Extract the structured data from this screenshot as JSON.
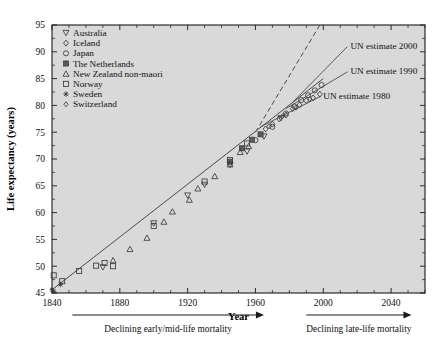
{
  "chart_data": {
    "type": "scatter",
    "title": "",
    "xlabel": "Year",
    "ylabel": "Life expectancy (years)",
    "xlim": [
      1840,
      2060
    ],
    "ylim": [
      45,
      95
    ],
    "xticks": [
      1840,
      1880,
      1920,
      1960,
      2000,
      2040
    ],
    "yticks": [
      45,
      50,
      55,
      60,
      65,
      70,
      75,
      80,
      85,
      90,
      95
    ],
    "xtick_step_minor": 10,
    "ytick_step_minor": 2.5,
    "grid": false,
    "background": "#d9d9d9",
    "legend_position": "upper-left",
    "series": [
      {
        "name": "Australia",
        "marker": "triangle-down",
        "points": [
          [
            1870,
            49.8
          ],
          [
            1900,
            58.0
          ],
          [
            1920,
            63.2
          ],
          [
            1930,
            65.2
          ],
          [
            1945,
            68.9
          ],
          [
            1955,
            71.4
          ],
          [
            1965,
            74.2
          ],
          [
            1975,
            77.6
          ]
        ]
      },
      {
        "name": "Iceland",
        "marker": "diamond",
        "points": [
          [
            1966,
            75.6
          ],
          [
            1970,
            76.5
          ],
          [
            1974,
            77.5
          ],
          [
            1978,
            78.2
          ],
          [
            1982,
            79.4
          ],
          [
            1986,
            80.1
          ],
          [
            1990,
            80.9
          ],
          [
            1994,
            81.4
          ],
          [
            1998,
            82.1
          ]
        ]
      },
      {
        "name": "Japan",
        "marker": "circle",
        "points": [
          [
            1960,
            73.5
          ],
          [
            1970,
            76.0
          ],
          [
            1978,
            78.5
          ],
          [
            1983,
            79.8
          ],
          [
            1987,
            81.0
          ],
          [
            1991,
            81.9
          ],
          [
            1995,
            82.8
          ],
          [
            1999,
            83.8
          ]
        ]
      },
      {
        "name": "The Netherlands",
        "marker": "square-filled",
        "points": [
          [
            1945,
            69.5
          ],
          [
            1952,
            72.0
          ],
          [
            1958,
            73.6
          ],
          [
            1963,
            74.6
          ]
        ]
      },
      {
        "name": "New Zealand non-maori",
        "marker": "triangle-up",
        "points": [
          [
            1876,
            51.1
          ],
          [
            1886,
            53.2
          ],
          [
            1896,
            55.3
          ],
          [
            1906,
            58.3
          ],
          [
            1911,
            60.2
          ],
          [
            1921,
            62.4
          ],
          [
            1926,
            64.5
          ],
          [
            1936,
            66.8
          ],
          [
            1945,
            69.0
          ],
          [
            1951,
            71.3
          ],
          [
            1956,
            72.4
          ]
        ]
      },
      {
        "name": "Norway",
        "marker": "square",
        "points": [
          [
            1841,
            48.3
          ],
          [
            1846,
            47.2
          ],
          [
            1856,
            49.1
          ],
          [
            1866,
            50.1
          ],
          [
            1871,
            50.6
          ],
          [
            1876,
            50.0
          ],
          [
            1900,
            57.5
          ],
          [
            1930,
            65.8
          ],
          [
            1945,
            69.8
          ],
          [
            1955,
            72.9
          ]
        ]
      },
      {
        "name": "Sweden",
        "marker": "asterisk",
        "points": [
          [
            1840,
            45.6
          ],
          [
            1841,
            45.3
          ],
          [
            1845,
            46.6
          ]
        ]
      },
      {
        "name": "Switzerland",
        "marker": "diamond-small",
        "points": [
          [
            1968,
            76.1
          ],
          [
            1976,
            78.0
          ],
          [
            1984,
            79.6
          ],
          [
            1992,
            81.2
          ]
        ]
      }
    ],
    "trend_line": {
      "label": "best-practice linear trend",
      "style": "solid",
      "from": [
        1840,
        45.6
      ],
      "to": [
        2000,
        85.0
      ],
      "slope_years_per_decade": 2.4
    },
    "trend_extension": {
      "label": "linear extrapolation",
      "style": "dashed",
      "from": [
        1960,
        75.0
      ],
      "to": [
        1998,
        95.0
      ]
    },
    "annotations": [
      {
        "text": "UN estimate 2000",
        "x": 2016,
        "y": 90.5,
        "target_x": 1982,
        "target_y": 80.6
      },
      {
        "text": "UN estimate 1990",
        "x": 2016,
        "y": 85.8,
        "target_x": 1978,
        "target_y": 79.4
      },
      {
        "text": "UN estimate 1980",
        "x": 2000,
        "y": 81.2,
        "target_x": 1963,
        "target_y": 76.0
      }
    ],
    "footnotes": [
      {
        "text": "Declining early/mid-life mortality",
        "arrow_from_year": 1852,
        "arrow_to_year": 1965
      },
      {
        "text": "Declining late-life mortality",
        "arrow_from_year": 1990,
        "arrow_to_year": 2052
      }
    ]
  }
}
